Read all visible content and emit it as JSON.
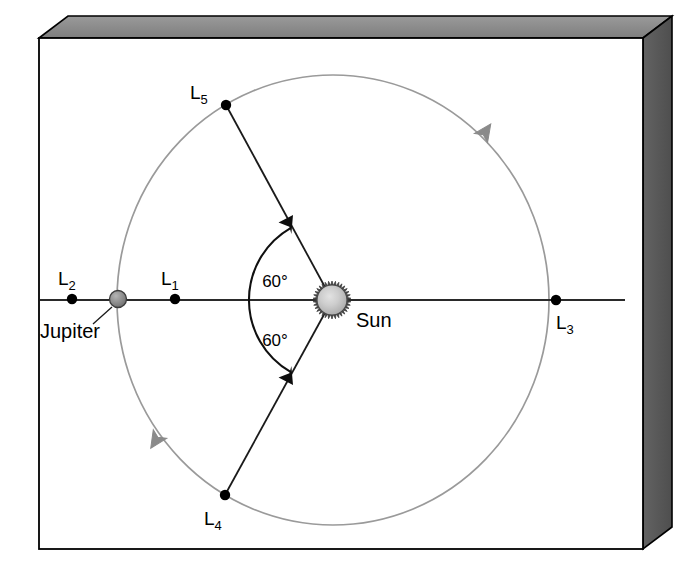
{
  "figure": {
    "kind": "lagrange-point-diagram",
    "system": "Sun-Jupiter",
    "frame_style": "3d-beveled-panel",
    "colors": {
      "panel_fill": "#ffffff",
      "panel_border": "#000000",
      "bevel_top": "#8c8c8c",
      "bevel_side": "#5a5a5a",
      "orbit_stroke": "#9a9a9a",
      "axis_stroke": "#2a2a2a",
      "line_stroke": "#1a1a1a",
      "dot_fill": "#000000",
      "sun_body": "#b9b9b9",
      "sun_highlight": "#d8d8d8",
      "sun_corona": "#3a3a3a",
      "jupiter_body": "#8f8f8f",
      "arrow_fill": "#7d7d7d"
    }
  },
  "bodies": {
    "sun": {
      "label": "Sun",
      "cx": 332,
      "cy": 300,
      "radius": 15,
      "corona_radius": 19,
      "label_x": 356,
      "label_y": 327
    },
    "jupiter": {
      "label": "Jupiter",
      "cx": 118,
      "cy": 299,
      "radius": 8,
      "label_x": 40,
      "label_y": 338,
      "leader_from_x": 112,
      "leader_from_y": 307,
      "leader_to_x": 93,
      "leader_to_y": 324
    }
  },
  "orbit": {
    "cx": 333,
    "cy": 300,
    "rx": 216,
    "ry": 225,
    "direction": "counterclockwise",
    "arrows": [
      {
        "name": "orbit-arrow-upper-right",
        "x": 481,
        "y": 138,
        "rotation": -55
      },
      {
        "name": "orbit-arrow-lower-left",
        "x": 160,
        "y": 434,
        "rotation": 123
      }
    ]
  },
  "axis": {
    "name": "sun-jupiter-axis",
    "x1": 40,
    "x2": 625,
    "y": 300
  },
  "lagrange_points": [
    {
      "id": "L1",
      "base": "L",
      "sub": "1",
      "x": 175,
      "y": 299,
      "label_x": 161,
      "label_y": 285,
      "label_anchor": "start"
    },
    {
      "id": "L2",
      "base": "L",
      "sub": "2",
      "x": 72,
      "y": 299,
      "label_x": 58,
      "label_y": 285,
      "label_anchor": "start"
    },
    {
      "id": "L3",
      "base": "L",
      "sub": "3",
      "x": 556,
      "y": 300,
      "label_x": 556,
      "label_y": 329,
      "label_anchor": "start"
    },
    {
      "id": "L4",
      "base": "L",
      "sub": "4",
      "x": 225,
      "y": 495,
      "label_x": 204,
      "label_y": 525,
      "label_anchor": "start"
    },
    {
      "id": "L5",
      "base": "L",
      "sub": "5",
      "x": 226,
      "y": 105,
      "label_x": 190,
      "label_y": 99,
      "label_anchor": "start"
    }
  ],
  "angles": [
    {
      "id": "angle-upper",
      "text": "60°",
      "x": 275,
      "y": 287,
      "from": "Sun-Jupiter axis",
      "to": "Sun-L5 line"
    },
    {
      "id": "angle-lower",
      "text": "60°",
      "x": 275,
      "y": 346,
      "from": "Sun-Jupiter axis",
      "to": "Sun-L4 line"
    }
  ],
  "angle_arc": {
    "name": "sixty-degree-double-arrow-arc",
    "radius": 83,
    "start_deg": -60,
    "end_deg": 60
  }
}
